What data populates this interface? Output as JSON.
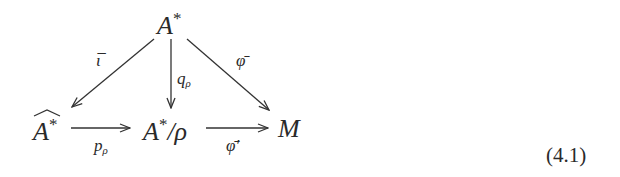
{
  "diagram": {
    "type": "commutative-diagram",
    "nodes": {
      "top": {
        "base": "A",
        "sup": "*"
      },
      "left": {
        "base": "A",
        "sup": "*",
        "accent": "hat"
      },
      "middle": {
        "base": "A",
        "sup": "*",
        "suffix": "/ρ"
      },
      "right": {
        "base": "M"
      }
    },
    "arrows": [
      {
        "from": "top",
        "to": "left",
        "label": "ῑ",
        "label_base": "ι̅"
      },
      {
        "from": "top",
        "to": "middle",
        "label_base": "q",
        "label_sub": "ρ"
      },
      {
        "from": "top",
        "to": "right",
        "label_base": "φ̄"
      },
      {
        "from": "left",
        "to": "middle",
        "label_base": "p",
        "label_sub": "ρ"
      },
      {
        "from": "middle",
        "to": "right",
        "label_base": "φ̄′"
      }
    ],
    "equation_number": "(4.1)"
  }
}
